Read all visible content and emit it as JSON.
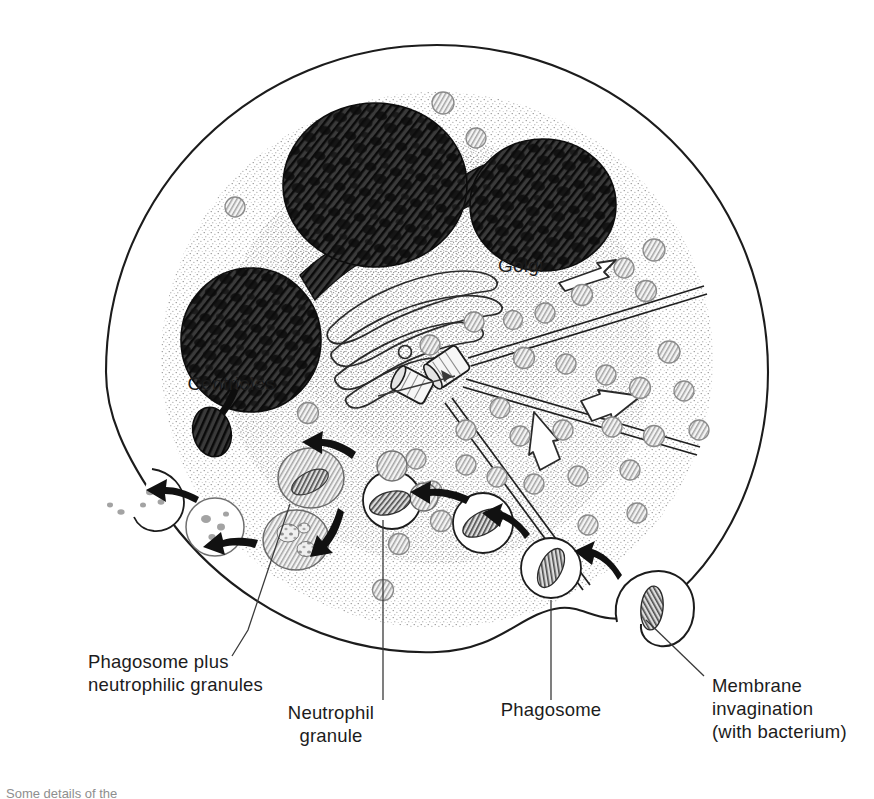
{
  "figure": {
    "domain": "scientific-illustration",
    "width": 874,
    "height": 795,
    "background": "#ffffff",
    "ink": "#1c1c1c"
  },
  "labels": {
    "golgi": "Golgi",
    "centrioles": "Centrioles",
    "phagosome_plus_granules_line1": "Phagosome plus",
    "phagosome_plus_granules_line2": "neutrophilic granules",
    "neutrophil_granule_line1": "Neutrophil",
    "neutrophil_granule_line2": "granule",
    "phagosome": "Phagosome",
    "membrane_invagination_line1": "Membrane",
    "membrane_invagination_line2": "invagination",
    "membrane_invagination_line3": "(with bacterium)"
  },
  "caption": {
    "text": "Some details of the",
    "clipped": true
  },
  "colors": {
    "outline": "#1c1c1c",
    "nucleus_fill": "#2b2b2b",
    "nucleus_hatch": "#000000",
    "granule_fill": "#f2f2f2",
    "granule_stroke": "#8a8a8a",
    "granule_hatch": "#9a9a9a",
    "cytoplasm_stipple": "#6f6f6f",
    "bacterium_fill": "#d8d8d8",
    "arrow_solid": "#111111",
    "arrow_hollow_stroke": "#2a2a2a",
    "microtubule": "#1f1f1f",
    "leader_line": "#3a3a3a"
  },
  "structures": {
    "cell_membrane": {
      "type": "closed-outline",
      "cx": 437,
      "cy": 370,
      "rx": 330,
      "ry": 325
    },
    "nucleus": {
      "type": "multilobed",
      "lobe_count": 3,
      "lobes": [
        {
          "name": "upper-left-lobe",
          "cx": 375,
          "cy": 185,
          "rx": 92,
          "ry": 82
        },
        {
          "name": "upper-right-lobe",
          "cx": 543,
          "cy": 205,
          "rx": 73,
          "ry": 66
        },
        {
          "name": "lower-left-lobe",
          "cx": 251,
          "cy": 340,
          "rx": 70,
          "ry": 72
        }
      ],
      "drumstick_appendage": {
        "cx": 213,
        "cy": 432,
        "rx": 19,
        "ry": 25
      }
    },
    "golgi": {
      "type": "stacked-cisternae",
      "cisterna_count": 4,
      "vesicle_count": 1
    },
    "centrioles": {
      "type": "paired-cylinders",
      "count": 2,
      "orientation": "orthogonal"
    },
    "microtubules": {
      "type": "radiating-tubules",
      "count": 3
    },
    "hollow_arrows": {
      "count": 3,
      "meaning": "granule traffic direction"
    },
    "granules": {
      "type": "neutrophilic-granules",
      "approx_count": 34,
      "diameter_px": 21
    }
  },
  "phagocytosis_sequence": {
    "direction": "right-to-left",
    "steps": [
      {
        "order": 1,
        "name": "membrane-invagination",
        "label_key": "membrane_invagination_line1",
        "cx": 655,
        "cy": 610
      },
      {
        "order": 2,
        "name": "phagosome-with-bacterium",
        "label_key": "phagosome",
        "cx": 551,
        "cy": 568
      },
      {
        "order": 3,
        "name": "phagosome-rising",
        "label_key": null,
        "cx": 483,
        "cy": 523
      },
      {
        "order": 4,
        "name": "granule-fusion",
        "label_key": "neutrophil_granule_line1",
        "cx": 392,
        "cy": 497
      },
      {
        "order": 5,
        "name": "digestion-phagolysosome",
        "label_key": "phagosome_plus_granules_line1",
        "cx": 311,
        "cy": 479
      },
      {
        "order": 6,
        "name": "late-digestion",
        "label_key": null,
        "cx": 296,
        "cy": 537
      },
      {
        "order": 7,
        "name": "residual-body",
        "label_key": null,
        "cx": 215,
        "cy": 525
      },
      {
        "order": 8,
        "name": "exocytosis-at-membrane",
        "label_key": null,
        "cx": 152,
        "cy": 497
      }
    ]
  }
}
